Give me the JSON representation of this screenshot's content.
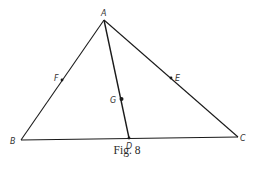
{
  "figure": {
    "caption": "Fig. 8",
    "stroke_color": "#1a1a1a",
    "points": {
      "A": {
        "label": "A",
        "x": 104,
        "y": 20
      },
      "B": {
        "label": "B",
        "x": 21,
        "y": 140
      },
      "C": {
        "label": "C",
        "x": 238,
        "y": 137
      },
      "D": {
        "label": "D",
        "x": 129,
        "y": 138
      },
      "E": {
        "label": "E",
        "x": 171,
        "y": 78
      },
      "F": {
        "label": "F",
        "x": 62,
        "y": 80
      },
      "G": {
        "label": "G",
        "x": 121,
        "y": 99
      }
    },
    "segments": [
      [
        "A",
        "B"
      ],
      [
        "A",
        "C"
      ],
      [
        "B",
        "C"
      ],
      [
        "A",
        "D"
      ]
    ],
    "marked_points": [
      "F",
      "E",
      "G",
      "D"
    ]
  }
}
